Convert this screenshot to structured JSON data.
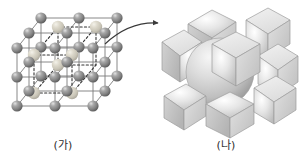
{
  "figure": {
    "background_color": "#ffffff"
  },
  "panels": [
    {
      "id": "lattice",
      "caption": "(가)",
      "description": "Extended cubic lattice of gray spheres with dashed unit-cell outline",
      "sphere_color": "#8a8a8a",
      "sphere_highlight_color": "#d9d9d9",
      "sphere_shadow_color": "#5e5e5e",
      "highlight_sphere_color": "#d6d4cc",
      "bond_color": "#7a7a7a",
      "dashed_outline_color": "#3a3a3a",
      "lattice_dimensions": "3 x 3 x 3",
      "sphere_radius_px": 5.6,
      "highlight_sphere_radius_px": 6.2
    },
    {
      "id": "unitcell",
      "caption": "(나)",
      "description": "Expanded body-centered cubic unit cell: eight corner octants and one central sphere",
      "corner_piece_count": 8,
      "center_sphere_count": 1,
      "face_light_color": "#e8e8e8",
      "face_mid_color": "#cfcfcf",
      "face_dark_color": "#b0b0b0",
      "sphere_light_color": "#efefef",
      "sphere_mid_color": "#cacaca",
      "sphere_dark_color": "#a8a8a8",
      "outline_color": "#9a9a9a"
    }
  ],
  "arrow": {
    "name": "expansion-arrow",
    "color": "#3a3a3a",
    "direction": "left-to-right",
    "style": "curved-with-arrowhead"
  }
}
